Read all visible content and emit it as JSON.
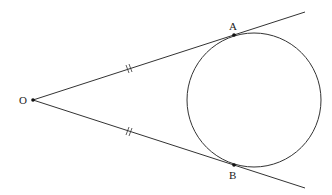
{
  "diagram": {
    "points": {
      "O": {
        "label": "O",
        "x": 33,
        "y": 100
      },
      "A": {
        "label": "A",
        "x": 234,
        "y": 35
      },
      "B": {
        "label": "B",
        "x": 234,
        "y": 165
      }
    },
    "circle": {
      "cx": 254,
      "cy": 100,
      "r": 67
    },
    "tangent_lines": [
      {
        "from": "O",
        "through": "A",
        "end_x": 305,
        "end_y": 12
      },
      {
        "from": "O",
        "through": "B",
        "end_x": 305,
        "end_y": 188
      }
    ],
    "equal_marks": "OA = OB (double tick marks)",
    "stroke_color": "#333333"
  }
}
